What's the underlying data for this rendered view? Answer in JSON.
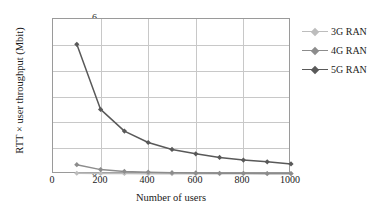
{
  "chart_data": {
    "type": "line",
    "title": "",
    "xlabel": "Number of users",
    "ylabel": "RTT × user throughput (Mbit)",
    "xlim": [
      0,
      1000
    ],
    "ylim": [
      0,
      6
    ],
    "xticks": [
      "0",
      "200",
      "400",
      "600",
      "800",
      "1000"
    ],
    "yticks": [
      "0",
      "1",
      "2",
      "3",
      "4",
      "5",
      "6"
    ],
    "grid": "both",
    "legend_position": "right",
    "x": [
      100,
      200,
      300,
      400,
      500,
      600,
      700,
      800,
      900,
      1000
    ],
    "series": [
      {
        "name": "3G RAN",
        "color": "#bdbdbd",
        "marker": "diamond",
        "values": [
          0.03,
          0.02,
          0.02,
          0.01,
          0.01,
          0.01,
          0.01,
          0.01,
          0.01,
          0.01
        ]
      },
      {
        "name": "4G RAN",
        "color": "#8c8c8c",
        "marker": "diamond",
        "values": [
          0.36,
          0.17,
          0.1,
          0.07,
          0.05,
          0.04,
          0.03,
          0.03,
          0.02,
          0.02
        ]
      },
      {
        "name": "5G RAN",
        "color": "#595959",
        "marker": "diamond",
        "values": [
          5.02,
          2.5,
          1.66,
          1.22,
          0.95,
          0.78,
          0.64,
          0.54,
          0.47,
          0.39
        ]
      }
    ]
  },
  "legend": {
    "entries": [
      {
        "label": "3G RAN"
      },
      {
        "label": "4G RAN"
      },
      {
        "label": "5G RAN"
      }
    ]
  },
  "axes": {
    "x_title": "Number of users",
    "y_title": "RTT × user throughput (Mbit)"
  }
}
